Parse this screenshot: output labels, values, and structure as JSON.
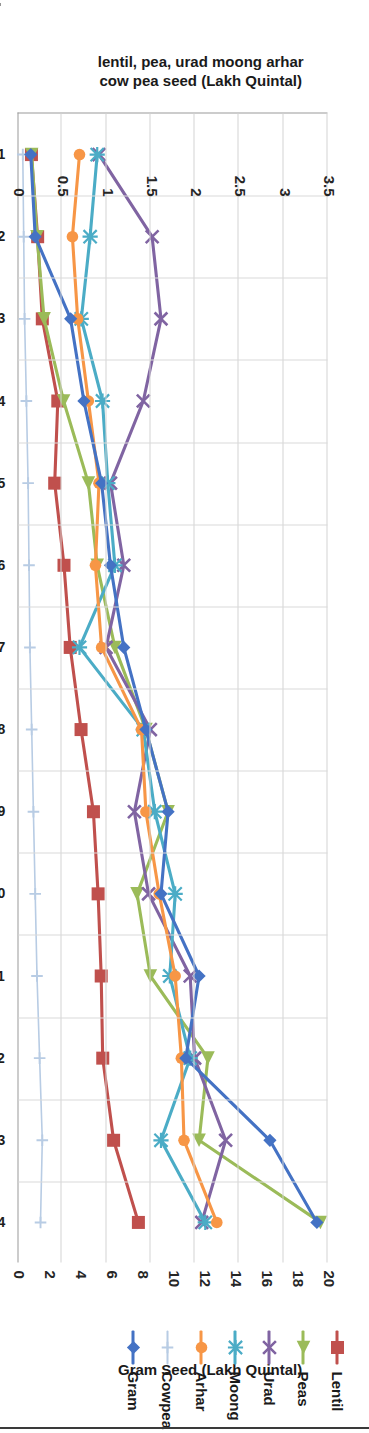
{
  "chart_data": {
    "type": "line",
    "title": "",
    "categories": [
      "2000-01",
      "2001-02",
      "2002-03",
      "2003-04",
      "2004-05",
      "2005-06",
      "2006-07",
      "2007-08",
      "2008-09",
      "2009-10",
      "2010-11",
      "2011-12",
      "2012-13",
      "2013-14"
    ],
    "xlabel": "",
    "axes": {
      "primary": {
        "label": "lentil, pea, urad moong arhar cow pea seed (Lakh Quintal)",
        "ticks": [
          "0",
          "0.5",
          "1",
          "1.5",
          "2",
          "2.5",
          "3",
          "3.5"
        ],
        "min": 0,
        "max": 3.5,
        "position": "left"
      },
      "secondary": {
        "label": "Gram Seed (Lakh Quintal)",
        "ticks": [
          "0",
          "2",
          "4",
          "6",
          "8",
          "10",
          "12",
          "14",
          "16",
          "18",
          "20"
        ],
        "min": 0,
        "max": 20,
        "position": "right"
      }
    },
    "grid": true,
    "legend_position": "right",
    "series": [
      {
        "name": "Lentil",
        "axis": "secondary",
        "color": "#C0504D",
        "marker": "square",
        "values": [
          0.9,
          1.3,
          1.6,
          2.6,
          2.4,
          3.0,
          3.4,
          4.1,
          4.9,
          5.2,
          5.4,
          5.5,
          6.2,
          7.8
        ]
      },
      {
        "name": "Peas",
        "axis": "primary",
        "color": "#9BBB59",
        "marker": "triangle",
        "values": [
          0.16,
          0.22,
          0.3,
          0.52,
          0.8,
          0.9,
          1.1,
          1.45,
          1.7,
          1.35,
          1.5,
          2.15,
          2.05,
          3.42
        ]
      },
      {
        "name": "Urad",
        "axis": "primary",
        "color": "#8064A2",
        "marker": "cross",
        "values": [
          0.92,
          1.52,
          1.62,
          1.42,
          1.05,
          1.2,
          1.0,
          1.5,
          1.32,
          1.48,
          1.95,
          2.0,
          2.35,
          2.08
        ]
      },
      {
        "name": "Moong",
        "axis": "primary",
        "color": "#4BACC6",
        "marker": "star",
        "values": [
          0.9,
          0.82,
          0.72,
          0.96,
          1.02,
          1.1,
          0.7,
          1.42,
          1.55,
          1.78,
          1.72,
          1.95,
          1.62,
          2.12
        ]
      },
      {
        "name": "Arhar",
        "axis": "primary",
        "color": "#F79646",
        "marker": "circle",
        "values": [
          0.7,
          0.62,
          0.68,
          0.8,
          0.92,
          0.88,
          0.95,
          1.4,
          1.45,
          1.6,
          1.78,
          1.85,
          1.88,
          2.25
        ]
      },
      {
        "name": "Cowpea",
        "axis": "primary",
        "color": "#B8CCE4",
        "marker": "plus",
        "values": [
          0.06,
          0.07,
          0.08,
          0.1,
          0.12,
          0.13,
          0.14,
          0.16,
          0.18,
          0.2,
          0.22,
          0.25,
          0.28,
          0.26
        ]
      },
      {
        "name": "Gram",
        "axis": "primary",
        "color": "#4472C4",
        "marker": "diamond",
        "values": [
          0.15,
          0.2,
          0.6,
          0.75,
          0.95,
          1.05,
          1.2,
          1.45,
          1.7,
          1.62,
          2.05,
          1.9,
          2.85,
          3.38
        ]
      }
    ]
  }
}
